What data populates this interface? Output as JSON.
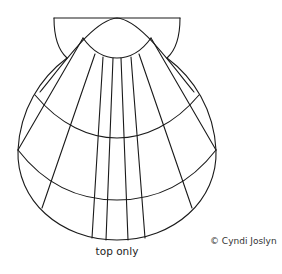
{
  "diagram": {
    "stroke_color": "#1a1a1a",
    "background": "#ffffff"
  },
  "caption": "top only",
  "copyright": "© Cyndi Joslyn"
}
